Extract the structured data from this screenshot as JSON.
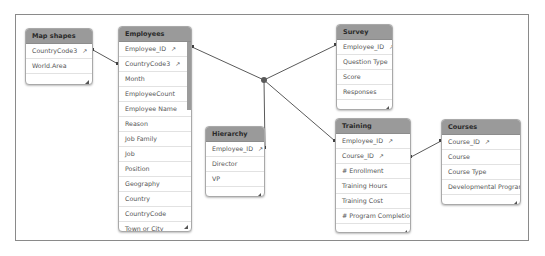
{
  "tables": {
    "mapshapes": {
      "title": "Map shapes",
      "fields": [
        {
          "name": "CountryCode3",
          "key": true
        },
        {
          "name": "World.Area",
          "key": false
        }
      ]
    },
    "employees": {
      "title": "Employees",
      "fields": [
        {
          "name": "Employee_ID",
          "key": true
        },
        {
          "name": "CountryCode3",
          "key": true
        },
        {
          "name": "Month",
          "key": false
        },
        {
          "name": "EmployeeCount",
          "key": false
        },
        {
          "name": "Employee Name",
          "key": false
        },
        {
          "name": "Reason",
          "key": false
        },
        {
          "name": "Job Family",
          "key": false
        },
        {
          "name": "Job",
          "key": false
        },
        {
          "name": "Position",
          "key": false
        },
        {
          "name": "Geography",
          "key": false
        },
        {
          "name": "Country",
          "key": false
        },
        {
          "name": "CountryCode",
          "key": false
        },
        {
          "name": "Town or City",
          "key": false
        }
      ]
    },
    "hierarchy": {
      "title": "Hierarchy",
      "fields": [
        {
          "name": "Employee_ID",
          "key": true
        },
        {
          "name": "Director",
          "key": false
        },
        {
          "name": "VP",
          "key": false
        }
      ]
    },
    "survey": {
      "title": "Survey",
      "fields": [
        {
          "name": "Employee_ID",
          "key": true
        },
        {
          "name": "Question Type",
          "key": false
        },
        {
          "name": "Score",
          "key": false
        },
        {
          "name": "Responses",
          "key": false
        }
      ]
    },
    "training": {
      "title": "Training",
      "fields": [
        {
          "name": "Employee_ID",
          "key": true
        },
        {
          "name": "Course_ID",
          "key": true
        },
        {
          "name": "# Enrollment",
          "key": false
        },
        {
          "name": "Training Hours",
          "key": false
        },
        {
          "name": "Training Cost",
          "key": false
        },
        {
          "name": "# Program Completion",
          "key": false
        }
      ]
    },
    "courses": {
      "title": "Courses",
      "fields": [
        {
          "name": "Course_ID",
          "key": true
        },
        {
          "name": "Course",
          "key": false
        },
        {
          "name": "Course Type",
          "key": false
        },
        {
          "name": "Developmental Program",
          "key": false
        }
      ]
    }
  },
  "icons": {
    "key": "key-icon",
    "resize": "resize-handle-icon"
  },
  "key_glyph": "↗",
  "colors": {
    "header": "#9a9a9a",
    "link": "#5a5a5a",
    "hub": "#5a5a5a"
  }
}
